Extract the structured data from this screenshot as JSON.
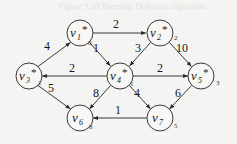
{
  "diagram": {
    "type": "weighted-directed-graph",
    "caption_bleed": "Figure 9.20 Running Dijkstra's algorithm",
    "nodes": [
      {
        "id": "v1",
        "name": "v",
        "sub": "1",
        "known": true,
        "star": "*",
        "dist": "0",
        "x": 80,
        "y": 33
      },
      {
        "id": "v2",
        "name": "v",
        "sub": "2",
        "known": true,
        "star": "*",
        "dist": "2",
        "x": 160,
        "y": 33
      },
      {
        "id": "v3",
        "name": "v",
        "sub": "3",
        "known": true,
        "star": "*",
        "dist": "1",
        "x": 29,
        "y": 76
      },
      {
        "id": "v4",
        "name": "v",
        "sub": "4",
        "known": true,
        "star": "*",
        "dist": "1",
        "x": 120,
        "y": 76
      },
      {
        "id": "v5",
        "name": "v",
        "sub": "5",
        "known": true,
        "star": "*",
        "dist": "3",
        "x": 201,
        "y": 76
      },
      {
        "id": "v6",
        "name": "v",
        "sub": "6",
        "known": false,
        "star": "",
        "dist": "8",
        "x": 80,
        "y": 118
      },
      {
        "id": "v7",
        "name": "v",
        "sub": "7",
        "known": false,
        "star": "",
        "dist": "5",
        "x": 160,
        "y": 118
      }
    ],
    "edges": [
      {
        "from": "v3",
        "to": "v1",
        "weight": "4"
      },
      {
        "from": "v1",
        "to": "v2",
        "weight": "2"
      },
      {
        "from": "v1",
        "to": "v4",
        "weight": "1"
      },
      {
        "from": "v4",
        "to": "v2",
        "weight": "3"
      },
      {
        "from": "v2",
        "to": "v5",
        "weight": "10"
      },
      {
        "from": "v4",
        "to": "v3",
        "weight": "2"
      },
      {
        "from": "v4",
        "to": "v5",
        "weight": "2"
      },
      {
        "from": "v3",
        "to": "v6",
        "weight": "5"
      },
      {
        "from": "v4",
        "to": "v6",
        "weight": "8"
      },
      {
        "from": "v4",
        "to": "v7",
        "weight": "4"
      },
      {
        "from": "v5",
        "to": "v7",
        "weight": "6"
      },
      {
        "from": "v7",
        "to": "v6",
        "weight": "1"
      }
    ]
  },
  "colors": {
    "background": "#f4f4f2",
    "stroke": "#3a3a3a",
    "text": "#1a1a1a"
  }
}
